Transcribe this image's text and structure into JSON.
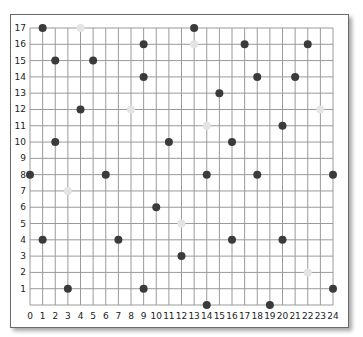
{
  "chart_data": {
    "type": "scatter",
    "title": "",
    "xlabel": "",
    "ylabel": "",
    "xlim": [
      0,
      24
    ],
    "ylim": [
      0,
      17
    ],
    "x_ticks": [
      0,
      1,
      2,
      3,
      4,
      5,
      6,
      7,
      8,
      9,
      10,
      11,
      12,
      13,
      14,
      15,
      16,
      17,
      18,
      19,
      20,
      21,
      22,
      23,
      24
    ],
    "y_ticks": [
      1,
      2,
      3,
      4,
      5,
      6,
      7,
      8,
      9,
      10,
      11,
      12,
      13,
      14,
      15,
      16,
      17
    ],
    "grid": true,
    "legend": null,
    "series": [
      {
        "name": "dark-points",
        "color": "#3b3b3b",
        "points": [
          [
            1,
            17
          ],
          [
            13,
            17
          ],
          [
            9,
            16
          ],
          [
            17,
            16
          ],
          [
            22,
            16
          ],
          [
            2,
            15
          ],
          [
            5,
            15
          ],
          [
            9,
            14
          ],
          [
            18,
            14
          ],
          [
            21,
            14
          ],
          [
            15,
            13
          ],
          [
            4,
            12
          ],
          [
            20,
            11
          ],
          [
            2,
            10
          ],
          [
            11,
            10
          ],
          [
            16,
            10
          ],
          [
            0,
            8
          ],
          [
            6,
            8
          ],
          [
            14,
            8
          ],
          [
            18,
            8
          ],
          [
            24,
            8
          ],
          [
            10,
            6
          ],
          [
            1,
            4
          ],
          [
            7,
            4
          ],
          [
            16,
            4
          ],
          [
            20,
            4
          ],
          [
            12,
            3
          ],
          [
            3,
            1
          ],
          [
            9,
            1
          ],
          [
            24,
            1
          ],
          [
            14,
            0
          ],
          [
            19,
            0
          ]
        ]
      },
      {
        "name": "faint-points",
        "color": "#e4e4e4",
        "points": [
          [
            4,
            17
          ],
          [
            13,
            16
          ],
          [
            8,
            12
          ],
          [
            23,
            12
          ],
          [
            14,
            11
          ],
          [
            3,
            7
          ],
          [
            12,
            5
          ],
          [
            22,
            2
          ]
        ]
      }
    ]
  },
  "layout": {
    "x0_px": 30,
    "x24_px": 333,
    "y0_px": 305,
    "y17_px": 28,
    "grid_color": "#9a9a9a",
    "point_radius": 4
  }
}
